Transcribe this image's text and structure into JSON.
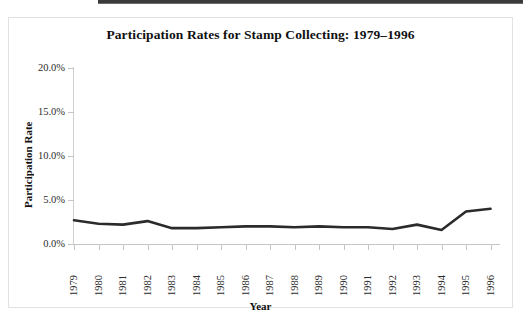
{
  "figure": {
    "top_rule": "horizontal-rule",
    "border_color": "#e2e2e2"
  },
  "chart_data": {
    "type": "line",
    "title": "Participation Rates for Stamp Collecting: 1979–1996",
    "xlabel": "Year",
    "ylabel": "Participation Rate",
    "categories": [
      "1979",
      "1980",
      "1981",
      "1982",
      "1983",
      "1984",
      "1985",
      "1986",
      "1987",
      "1988",
      "1989",
      "1990",
      "1991",
      "1992",
      "1993",
      "1994",
      "1995",
      "1996"
    ],
    "values": [
      2.7,
      2.3,
      2.2,
      2.6,
      1.8,
      1.8,
      1.9,
      2.0,
      2.0,
      1.9,
      2.0,
      1.9,
      1.9,
      1.7,
      2.2,
      1.6,
      3.7,
      4.0
    ],
    "ylim": [
      0.0,
      20.0
    ],
    "ytick_labels": [
      "0.0%",
      "5.0%",
      "10.0%",
      "15.0%",
      "20.0%"
    ],
    "ytick_values": [
      0,
      5,
      10,
      15,
      20
    ],
    "grid": false,
    "legend": "none",
    "series_color": "#2b2b2b",
    "line_width": 2.6,
    "axis_color": "#c4c4c4"
  }
}
